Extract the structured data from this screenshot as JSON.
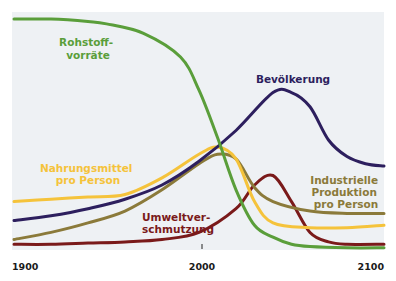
{
  "chart_data": {
    "type": "line",
    "title": "",
    "xlabel": "",
    "ylabel": "",
    "xlim": [
      1900,
      2100
    ],
    "ylim": [
      0,
      100
    ],
    "grid": false,
    "legend": "inline labels",
    "x_ticks": [
      "1900",
      "2000",
      "2100"
    ],
    "series": [
      {
        "name": "Rohstoffvorräte",
        "label_lines": [
          "Rohstoff-",
          "vorräte"
        ],
        "color": "#5a9e3a",
        "x": [
          1900,
          1920,
          1940,
          1950,
          1970,
          1990,
          2000,
          2010,
          2020,
          2030,
          2040,
          2050,
          2060,
          2080,
          2100
        ],
        "values": [
          97,
          97,
          96,
          95,
          91,
          81,
          67,
          47,
          25,
          10,
          5,
          2,
          1,
          0.5,
          0.5
        ]
      },
      {
        "name": "Bevölkerung",
        "label_lines": [
          "Bevölkerung"
        ],
        "color": "#2d1f5e",
        "x": [
          1900,
          1920,
          1940,
          1960,
          1980,
          2000,
          2020,
          2040,
          2050,
          2060,
          2070,
          2080,
          2090,
          2100
        ],
        "values": [
          12,
          14,
          17,
          21,
          27,
          37,
          50,
          66,
          66,
          60,
          46,
          39,
          36,
          35
        ]
      },
      {
        "name": "Nahrungsmittel pro Person",
        "label_lines": [
          "Nahrungsmittel",
          "pro Person"
        ],
        "color": "#f5c33b",
        "x": [
          1900,
          1920,
          1940,
          1960,
          1980,
          2000,
          2010,
          2020,
          2030,
          2040,
          2060,
          2080,
          2100
        ],
        "values": [
          20,
          21,
          22,
          23,
          30,
          40,
          43,
          38,
          20,
          11,
          9,
          9,
          10
        ]
      },
      {
        "name": "Industrielle Produktion pro Person",
        "label_lines": [
          "Industrielle",
          "Produktion",
          "pro Person"
        ],
        "color": "#8b7a3a",
        "x": [
          1900,
          1920,
          1940,
          1960,
          1980,
          2000,
          2010,
          2020,
          2030,
          2040,
          2060,
          2080,
          2100
        ],
        "values": [
          4,
          7,
          11,
          16,
          25,
          36,
          40,
          38,
          26,
          20,
          16,
          15,
          15
        ]
      },
      {
        "name": "Umweltverschmutzung",
        "label_lines": [
          "Umweltver-",
          "schmutzung"
        ],
        "color": "#7a1a1a",
        "x": [
          1900,
          1920,
          1940,
          1960,
          1980,
          2000,
          2020,
          2030,
          2040,
          2050,
          2060,
          2070,
          2080,
          2100
        ],
        "values": [
          2,
          2,
          2.5,
          3,
          4,
          7,
          17,
          27,
          31,
          20,
          7,
          3,
          2,
          2
        ]
      }
    ]
  }
}
